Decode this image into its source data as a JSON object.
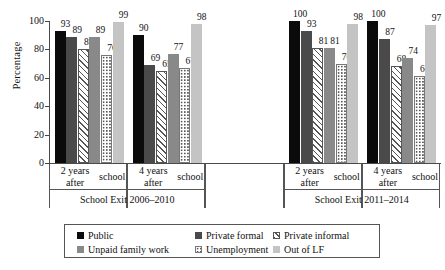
{
  "chart_data": {
    "type": "bar",
    "title": "",
    "xlabel": "",
    "ylabel": "Percentage",
    "ylim": [
      0,
      100
    ],
    "yticks": [
      0,
      20,
      40,
      60,
      80,
      100
    ],
    "grid": false,
    "legend_position": "bottom",
    "categories": [
      "2 years after school",
      "4 years after school",
      "",
      "2 years after school",
      "4 years after school"
    ],
    "category_lines": [
      [
        "2 years after",
        "school"
      ],
      [
        "4 years after",
        "school"
      ],
      [
        "",
        ""
      ],
      [
        "2 years after",
        "school"
      ],
      [
        "4 years after",
        "school"
      ]
    ],
    "supergroups": [
      {
        "label": "School Exit 2006–2010",
        "categories": [
          0,
          1
        ]
      },
      {
        "label": "School Exit 2011–2014",
        "categories": [
          3,
          4
        ]
      }
    ],
    "series": [
      {
        "name": "Public",
        "pattern": "solid-black",
        "color": "#0b0b0b",
        "values": [
          93,
          90,
          null,
          100,
          100
        ]
      },
      {
        "name": "Private formal",
        "pattern": "solid-darkgray",
        "color": "#4a4a4a",
        "values": [
          89,
          69,
          null,
          93,
          87
        ]
      },
      {
        "name": "Private informal",
        "pattern": "diagonal-hatch",
        "color": "#ffffff",
        "values": [
          80,
          65,
          null,
          81,
          68
        ]
      },
      {
        "name": "Unpaid family work",
        "pattern": "solid-midgray",
        "color": "#898989",
        "values": [
          89,
          77,
          null,
          81,
          74
        ]
      },
      {
        "name": "Unemployment",
        "pattern": "dotted",
        "color": "#ffffff",
        "values": [
          76,
          67,
          null,
          70,
          61
        ]
      },
      {
        "name": "Out of LF",
        "pattern": "solid-lightgray",
        "color": "#c4c4c4",
        "values": [
          99,
          98,
          null,
          98,
          97
        ]
      }
    ]
  },
  "axis": {
    "y_title": "Percentage"
  }
}
